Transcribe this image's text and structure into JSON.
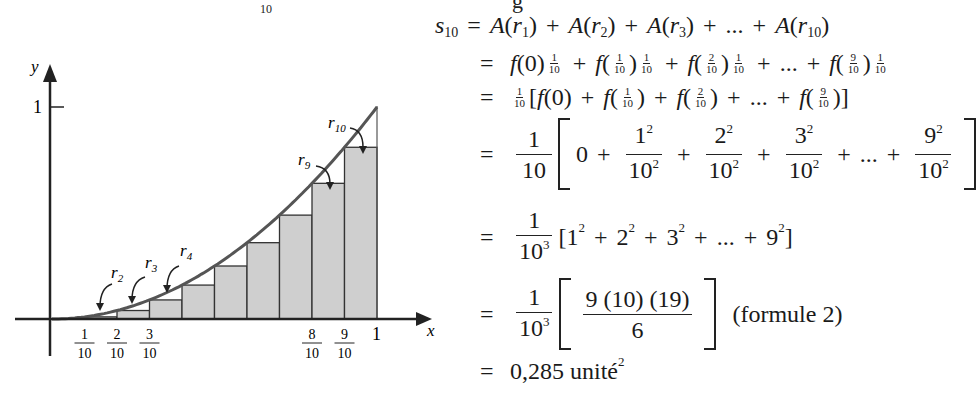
{
  "header_clip": {
    "sub": "10",
    "tail": "g"
  },
  "figure": {
    "y_axis_label": "y",
    "x_axis_label": "x",
    "y_tick_label": "1",
    "x_tick_labels": [
      {
        "num": "1",
        "den": "10"
      },
      {
        "num": "2",
        "den": "10"
      },
      {
        "num": "3",
        "den": "10"
      },
      {
        "num": "8",
        "den": "10"
      },
      {
        "num": "9",
        "den": "10"
      }
    ],
    "x_end_label": "1",
    "rect_labels": [
      "r2",
      "r3",
      "r4",
      "r9",
      "r10"
    ],
    "fill_color": "#cfcfcf",
    "curve_color": "#555555"
  },
  "chart_data": {
    "type": "bar",
    "xlabel": "x",
    "ylabel": "y",
    "xlim": [
      0,
      1
    ],
    "ylim": [
      0,
      1
    ],
    "categories": [
      "0",
      "0.1",
      "0.2",
      "0.3",
      "0.4",
      "0.5",
      "0.6",
      "0.7",
      "0.8",
      "0.9"
    ],
    "values": [
      0,
      0.01,
      0.04,
      0.09,
      0.16,
      0.25,
      0.36,
      0.49,
      0.64,
      0.81
    ],
    "curve": "y = x^2",
    "annotations": [
      "r2",
      "r3",
      "r4",
      "r9",
      "r10"
    ],
    "x_ticks": [
      "1/10",
      "2/10",
      "3/10",
      "8/10",
      "9/10",
      "1"
    ],
    "y_ticks": [
      "1"
    ],
    "grid": false
  },
  "math": {
    "line1": {
      "lhs": "s",
      "lhs_sub": "10",
      "eq": "=",
      "terms": [
        "A(r",
        "1",
        ")",
        "A(r",
        "2",
        ")",
        "A(r",
        "3",
        ")",
        "...",
        "A(r",
        "10",
        ")"
      ]
    },
    "line2": {
      "eq": "=",
      "f0": "f(0)",
      "one": "1",
      "ten": "10",
      "f": "f(",
      "close": ")",
      "n1": "1",
      "n2": "2",
      "n9": "9",
      "dots": "..."
    },
    "line3": {
      "eq": "=",
      "one": "1",
      "ten": "10",
      "open": "[",
      "f0": "f(0)",
      "f": "f(",
      "close": ")",
      "n1": "1",
      "n2": "2",
      "n9": "9",
      "dots": "...",
      "end": "]"
    },
    "line4": {
      "eq": "=",
      "one": "1",
      "ten": "10",
      "zero": "0",
      "terms": [
        "1",
        "2",
        "3",
        "9"
      ],
      "sq": "2",
      "den": "10",
      "dots": "..."
    },
    "line5": {
      "eq": "=",
      "one": "1",
      "ten": "10",
      "cube": "3",
      "open": "[",
      "terms": [
        "1",
        "2",
        "3",
        "9"
      ],
      "sq": "2",
      "dots": "...",
      "end": "]"
    },
    "line6": {
      "eq": "=",
      "one": "1",
      "ten": "10",
      "cube": "3",
      "num": "9 (10) (19)",
      "den": "6",
      "note": "(formule 2)"
    },
    "line7": {
      "eq": "=",
      "value": "0,285 unité",
      "sq": "2"
    }
  }
}
